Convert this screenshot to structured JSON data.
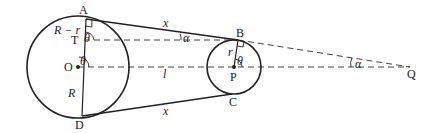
{
  "diagram": {
    "type": "belt-pulley-geometry",
    "circles": [
      {
        "name": "large-circle",
        "center_label": "O",
        "radius_label": "R"
      },
      {
        "name": "small-circle",
        "center_label": "P",
        "radius_label": "r"
      }
    ],
    "points": {
      "A": "A",
      "B": "B",
      "C": "C",
      "D": "D",
      "O": "O",
      "P": "P",
      "Q": "Q",
      "T": "T"
    },
    "labels": {
      "top_tangent": "x",
      "bottom_tangent": "x",
      "center_distance": "l",
      "r_minus_r": "R − r",
      "big_radius": "R",
      "small_radius": "r",
      "theta_at_A": "θ",
      "theta_at_O": "θ",
      "theta_at_P": "θ",
      "alpha_near_B": "α",
      "alpha_at_Q": "α"
    },
    "colors": {
      "stroke": "#222222",
      "dashed": "#444444",
      "background": "#ffffff"
    }
  }
}
